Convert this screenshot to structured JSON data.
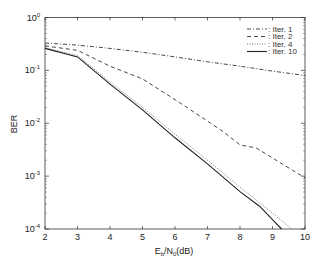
{
  "chart_data": {
    "type": "line",
    "title": "",
    "xlabel": "E_b/N_0(dB)",
    "xlabel_parts": {
      "e": "E",
      "e_sub": "b",
      "slash": "/N",
      "n_sub": "0",
      "unit": "(dB)"
    },
    "ylabel": "BER",
    "xlim": [
      2,
      10
    ],
    "ylim": [
      0.0001,
      1
    ],
    "yscale": "log",
    "x_ticks": [
      "2",
      "3",
      "4",
      "5",
      "6",
      "7",
      "8",
      "9",
      "10"
    ],
    "y_ticks": [
      {
        "base": "10",
        "exp": "0",
        "value": 1
      },
      {
        "base": "10",
        "exp": "-1",
        "value": 0.1
      },
      {
        "base": "10",
        "exp": "-2",
        "value": 0.01
      },
      {
        "base": "10",
        "exp": "-3",
        "value": 0.001
      },
      {
        "base": "10",
        "exp": "-4",
        "value": 0.0001
      }
    ],
    "grid": false,
    "legend_position": "upper right",
    "series": [
      {
        "name": "Iter. 1",
        "style": "dashdot",
        "x": [
          2,
          3,
          4,
          5,
          6,
          7,
          8,
          9,
          10
        ],
        "values": [
          0.33,
          0.3,
          0.26,
          0.22,
          0.18,
          0.145,
          0.12,
          0.097,
          0.08
        ]
      },
      {
        "name": "Iter. 2",
        "style": "dashed",
        "x": [
          2,
          3,
          4,
          5,
          6,
          7,
          7.5,
          8,
          8.5,
          9,
          10
        ],
        "values": [
          0.29,
          0.24,
          0.12,
          0.069,
          0.028,
          0.011,
          0.0068,
          0.0039,
          0.0034,
          0.0022,
          0.00093
        ]
      },
      {
        "name": "Iter. 4",
        "style": "dotted",
        "x": [
          2,
          3,
          4,
          5,
          6,
          7,
          8,
          9,
          9.59
        ],
        "values": [
          0.27,
          0.19,
          0.06,
          0.02,
          0.0062,
          0.002,
          0.00062,
          0.0002,
          0.0001
        ]
      },
      {
        "name": "Iter. 10",
        "style": "solid",
        "x": [
          2,
          3,
          4,
          5,
          6,
          7,
          8,
          8.6,
          9,
          9.28
        ],
        "values": [
          0.26,
          0.18,
          0.055,
          0.018,
          0.0053,
          0.0017,
          0.00051,
          0.00027,
          0.00015,
          0.0001
        ]
      }
    ]
  },
  "legend": {
    "items": [
      {
        "label": ": Iter. 1"
      },
      {
        "label": ": Iter. 2"
      },
      {
        "label": ": Iter. 4"
      },
      {
        "label": ": Iter. 10"
      }
    ]
  }
}
